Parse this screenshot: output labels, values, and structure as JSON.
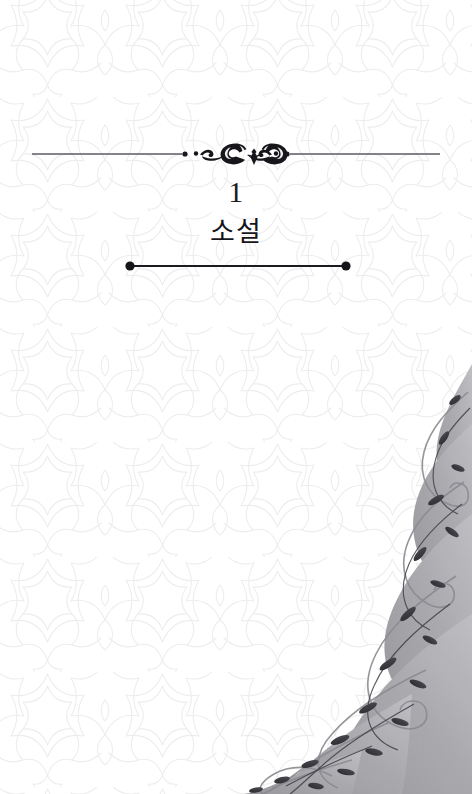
{
  "page": {
    "background_color": "#ffffff",
    "width": 472,
    "height": 794
  },
  "chapter": {
    "number": "1",
    "title": "소설",
    "number_color": "#1b1b1f",
    "title_color": "#15151a"
  },
  "ornaments": {
    "top_divider": {
      "icon_name": "flourish-divider-ornament",
      "color": "#1a1a20",
      "rule_color": "#5b5b63",
      "left_rule_start_x": 32,
      "right_rule_end_x": 440
    },
    "bottom_rule": {
      "icon_name": "dotted-end-rule",
      "color": "#1a1a1f",
      "start_x": 128,
      "end_x": 348
    },
    "corner_floral": {
      "icon_name": "floral-vine-corner-ornament",
      "color": "#9a9a9e",
      "accent_color": "#2a2a2e",
      "position": "bottom-right"
    }
  },
  "background": {
    "pattern_name": "islamic-star-rosette-lattice",
    "stroke_color": "#ececed",
    "tile_size": 115
  }
}
